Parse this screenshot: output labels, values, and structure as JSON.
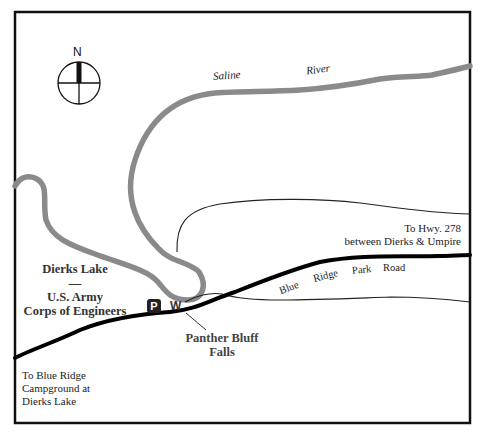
{
  "map": {
    "title_fragment": "",
    "compass": {
      "north_label": "N"
    },
    "river": {
      "name_word_1": "Saline",
      "name_word_2": "River",
      "color": "#8a8a8a"
    },
    "lake_label": {
      "line1": "Dierks Lake",
      "separator": "—",
      "line2": "U.S. Army",
      "line3": "Corps of Engineers"
    },
    "markers": {
      "parking": "P",
      "waterfall": "W"
    },
    "falls_label": {
      "line1": "Panther Bluff",
      "line2": "Falls"
    },
    "road": {
      "words": [
        "Blue",
        "Ridge",
        "Park",
        "Road"
      ],
      "east_destination": {
        "line1": "To Hwy. 278",
        "line2": "between Dierks & Umpire"
      },
      "west_destination": {
        "line1": "To Blue Ridge",
        "line2": "Campground at",
        "line3": "Dierks Lake"
      },
      "color": "#000000"
    },
    "colors": {
      "border": "#111111",
      "trail": "#222222",
      "background": "#ffffff"
    }
  }
}
